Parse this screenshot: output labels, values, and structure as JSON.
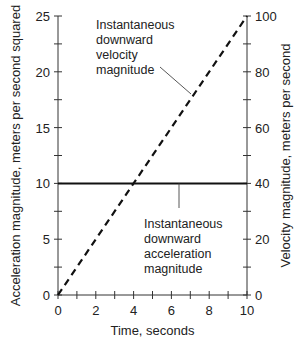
{
  "chart_data": {
    "type": "line",
    "title": "",
    "xlabel": "Time, seconds",
    "ylabel_left": "Acceleration magnitude, meters per second squared",
    "ylabel_right": "Velocity magnitude, meters per second",
    "xlim": [
      0,
      10
    ],
    "ylim_left": [
      0,
      25
    ],
    "ylim_right": [
      0,
      100
    ],
    "x_ticks": [
      0,
      2,
      4,
      6,
      8,
      10
    ],
    "y_left_ticks": [
      0,
      5,
      10,
      15,
      20,
      25
    ],
    "y_right_ticks": [
      0,
      20,
      40,
      60,
      80,
      100
    ],
    "grid": false,
    "legend": "none (inline annotations)",
    "series": [
      {
        "name": "Instantaneous downward velocity magnitude",
        "axis": "right",
        "style": "dashed",
        "x": [
          0,
          10
        ],
        "values": [
          0,
          100
        ]
      },
      {
        "name": "Instantaneous downward acceleration magnitude",
        "axis": "left",
        "style": "solid",
        "x": [
          0,
          10
        ],
        "values": [
          10,
          10
        ]
      }
    ],
    "annotations": [
      {
        "lines": [
          "Instantaneous",
          "downward",
          "velocity",
          "magnitude"
        ],
        "target_series": 0
      },
      {
        "lines": [
          "Instantaneous",
          "downward",
          "acceleration",
          "magnitude"
        ],
        "target_series": 1
      }
    ]
  }
}
